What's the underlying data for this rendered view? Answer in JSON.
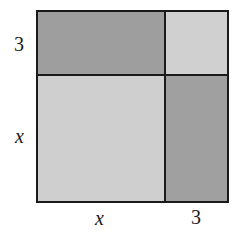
{
  "diagram": {
    "labels": {
      "left_top": "3",
      "left_bottom": "x",
      "bottom_left": "x",
      "bottom_right": "3"
    },
    "regions": [
      {
        "id": "top-left",
        "area": "3x",
        "color": "#9e9e9e"
      },
      {
        "id": "top-right",
        "area": "9",
        "color": "#d0d0d0"
      },
      {
        "id": "bottom-left",
        "area": "x^2",
        "color": "#cfcfcf"
      },
      {
        "id": "bottom-right",
        "area": "3x",
        "color": "#a0a0a0"
      }
    ]
  }
}
